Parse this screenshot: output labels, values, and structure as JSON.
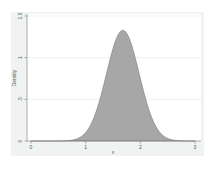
{
  "chart_data": {
    "type": "area",
    "title": "",
    "xlabel": "x",
    "ylabel": "Density",
    "xlim": [
      0,
      3
    ],
    "ylim": [
      0,
      1.5
    ],
    "x_ticks": [
      "0",
      "1",
      "2",
      "3"
    ],
    "y_ticks": [
      "0",
      ".5",
      "1",
      "1.5"
    ],
    "grid": true,
    "legend": null,
    "series": [
      {
        "name": "Density",
        "distribution": "normal",
        "mean": 1.68,
        "sd": 0.3,
        "peak_density": 1.33,
        "x": [
          0.6,
          0.8,
          1.0,
          1.1,
          1.2,
          1.3,
          1.4,
          1.5,
          1.6,
          1.68,
          1.8,
          1.9,
          2.0,
          2.1,
          2.2,
          2.3,
          2.4,
          2.6,
          2.8
        ],
        "values": [
          0.0,
          0.02,
          0.11,
          0.2,
          0.37,
          0.59,
          0.86,
          1.11,
          1.28,
          1.33,
          1.23,
          1.02,
          0.75,
          0.5,
          0.31,
          0.16,
          0.08,
          0.01,
          0.0
        ],
        "fill_color": "#a7a7a7",
        "line_color": "#6e6e6e"
      }
    ]
  },
  "colors": {
    "graph_background": "#f1f3f3",
    "plot_background": "#ffffff",
    "fill": "#a7a7a7",
    "axis": "#777777",
    "grid": "#e6e9ea"
  }
}
